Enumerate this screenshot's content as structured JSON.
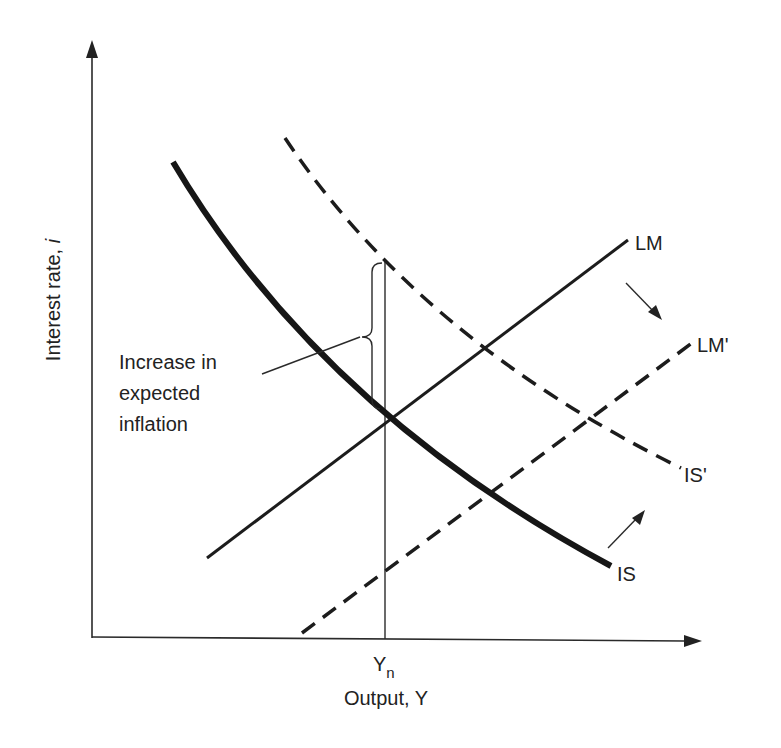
{
  "diagram": {
    "type": "IS-LM diagram",
    "axes": {
      "y_label": "Interest rate, i",
      "y_label_main": "Interest rate, ",
      "y_label_var": "i",
      "x_label": "Output, Y",
      "x_tick": "Y",
      "x_tick_subscript": "n"
    },
    "curves": [
      {
        "id": "IS",
        "label": "IS",
        "style": "thick-solid"
      },
      {
        "id": "IS_prime",
        "label": "IS'",
        "style": "dashed"
      },
      {
        "id": "LM",
        "label": "LM",
        "style": "solid"
      },
      {
        "id": "LM_prime",
        "label": "LM'",
        "style": "dashed"
      }
    ],
    "annotation": {
      "lines": [
        "Increase in",
        "expected",
        "inflation"
      ]
    },
    "shift_arrows": [
      {
        "id": "lm-shift",
        "direction": "down-right",
        "from": "LM",
        "to": "LM'"
      },
      {
        "id": "is-shift",
        "direction": "up-right",
        "from": "IS",
        "to": "IS'"
      }
    ],
    "colors": {
      "ink": "#1c1c1c",
      "background": "#ffffff"
    }
  }
}
